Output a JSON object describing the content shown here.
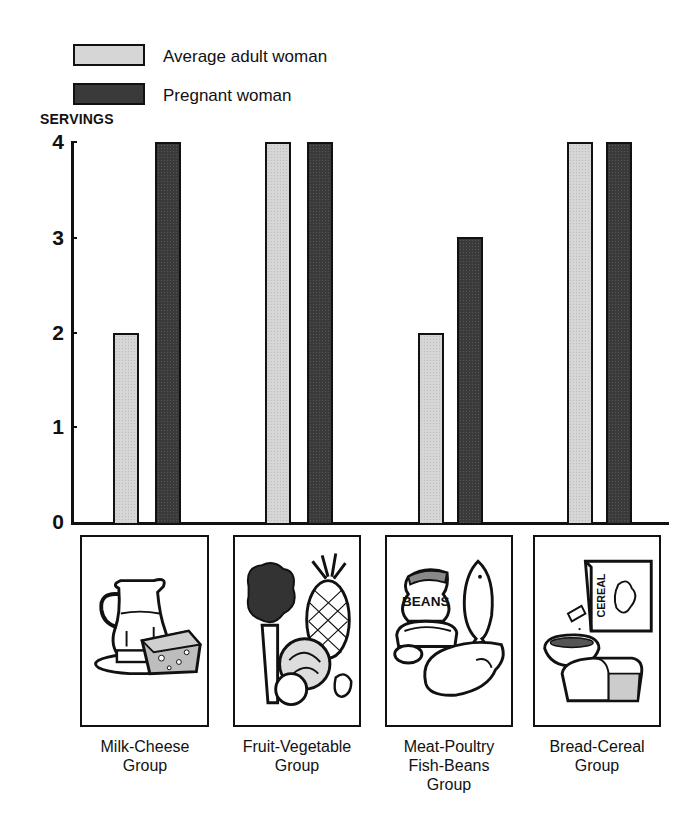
{
  "chart_data": {
    "type": "bar",
    "title": "",
    "xlabel": "",
    "ylabel": "SERVINGS",
    "ylim": [
      0,
      4
    ],
    "yticks": [
      0,
      1,
      2,
      3,
      4
    ],
    "grid": false,
    "legend_position": "top-left",
    "categories": [
      "Milk-Cheese Group",
      "Fruit-Vegetable Group",
      "Meat-Poultry Fish-Beans Group",
      "Bread-Cereal Group"
    ],
    "series": [
      {
        "name": "Average adult woman",
        "color": "#d6d6d6",
        "values": [
          2,
          4,
          2,
          4
        ]
      },
      {
        "name": "Pregnant woman",
        "color": "#3a3a3a",
        "values": [
          4,
          4,
          3,
          4
        ]
      }
    ]
  },
  "legend": {
    "items": [
      {
        "label": "Average adult woman",
        "color": "#d6d6d6"
      },
      {
        "label": "Pregnant woman",
        "color": "#3a3a3a"
      }
    ]
  },
  "axis": {
    "y_title": "SERVINGS",
    "ticks": [
      "0",
      "1",
      "2",
      "3",
      "4"
    ]
  },
  "groups": [
    {
      "label": "Milk-Cheese\nGroup",
      "icon": "milk-pitcher-cheese-icon"
    },
    {
      "label": "Fruit-Vegetable\nGroup",
      "icon": "fruit-vegetable-icon"
    },
    {
      "label": "Meat-Poultry\nFish-Beans\nGroup",
      "icon": "meat-fish-beans-icon"
    },
    {
      "label": "Bread-Cereal\nGroup",
      "icon": "bread-cereal-icon"
    }
  ],
  "illustration_text": {
    "beans": "BEANS",
    "cereal": "CEREAL"
  }
}
